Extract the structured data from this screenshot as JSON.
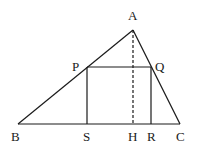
{
  "diagram": {
    "type": "geometry",
    "points": {
      "A": {
        "x": 133,
        "y": 30,
        "label": "A",
        "lx": 128,
        "ly": 20
      },
      "B": {
        "x": 18,
        "y": 124,
        "label": "B",
        "lx": 10,
        "ly": 141
      },
      "C": {
        "x": 180,
        "y": 124,
        "label": "C",
        "lx": 176,
        "ly": 141
      },
      "P": {
        "x": 87,
        "y": 67,
        "label": "P",
        "lx": 72,
        "ly": 71
      },
      "Q": {
        "x": 151,
        "y": 67,
        "label": "Q",
        "lx": 155,
        "ly": 71
      },
      "S": {
        "x": 87,
        "y": 124,
        "label": "S",
        "lx": 83,
        "ly": 141
      },
      "H": {
        "x": 133,
        "y": 124,
        "label": "H",
        "lx": 128,
        "ly": 141
      },
      "R": {
        "x": 151,
        "y": 124,
        "label": "R",
        "lx": 147,
        "ly": 141
      }
    },
    "segments": [
      {
        "from": "A",
        "to": "B",
        "style": "solid"
      },
      {
        "from": "A",
        "to": "C",
        "style": "solid"
      },
      {
        "from": "B",
        "to": "C",
        "style": "solid"
      },
      {
        "from": "P",
        "to": "Q",
        "style": "solid"
      },
      {
        "from": "P",
        "to": "S",
        "style": "solid"
      },
      {
        "from": "Q",
        "to": "R",
        "style": "solid"
      },
      {
        "from": "A",
        "to": "H",
        "style": "dashed"
      }
    ],
    "stroke_color": "#1a1a1a"
  }
}
